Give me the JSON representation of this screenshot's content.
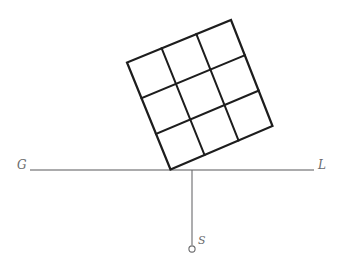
{
  "figure": {
    "background_color": "#ffffff",
    "width": 339,
    "height": 279,
    "labels": {
      "ground_left": "G",
      "ground_right": "L",
      "station_point": "S"
    },
    "colors": {
      "grid_stroke": "#1d1d1d",
      "ground_line": "#58585a",
      "drop_line": "#6a6a6c",
      "label_text": "#6b6b6d",
      "station_dot_fill": "#ffffff"
    },
    "ground_line": {
      "x1": 30,
      "y1": 170,
      "x2": 314,
      "y2": 170
    },
    "drop_line": {
      "x1": 192,
      "y1": 170,
      "x2": 192,
      "y2": 245
    },
    "station_dot": {
      "cx": 192,
      "cy": 249,
      "r": 3.1
    },
    "grid": {
      "divisions": 3,
      "corners": {
        "bottom": {
          "x": 170.5,
          "y": 169.5
        },
        "left": {
          "x": 127.0,
          "y": 62.5
        },
        "top": {
          "x": 231.0,
          "y": 20.0
        },
        "right": {
          "x": 272.5,
          "y": 126.0
        }
      }
    }
  }
}
